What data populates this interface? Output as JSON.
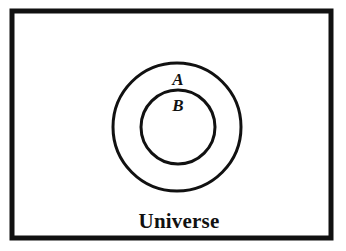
{
  "figure": {
    "kind": "venn-diagram",
    "background_color": "#ffffff",
    "stroke_color": "#111111",
    "canvas": {
      "width": 346,
      "height": 251
    }
  },
  "universe": {
    "label": "Universe",
    "shape": "rectangle",
    "x": 12,
    "y": 11,
    "width": 319,
    "height": 227,
    "stroke_width": 5,
    "label_x": 179,
    "label_y": 228
  },
  "sets": [
    {
      "id": "set-a",
      "label": "A",
      "shape": "circle",
      "cx": 177,
      "cy": 127,
      "r": 64,
      "stroke_width": 3,
      "label_x": 178,
      "label_y": 85
    },
    {
      "id": "set-b",
      "label": "B",
      "shape": "circle",
      "cx": 178,
      "cy": 127,
      "r": 37,
      "stroke_width": 3,
      "label_x": 178,
      "label_y": 111
    }
  ]
}
